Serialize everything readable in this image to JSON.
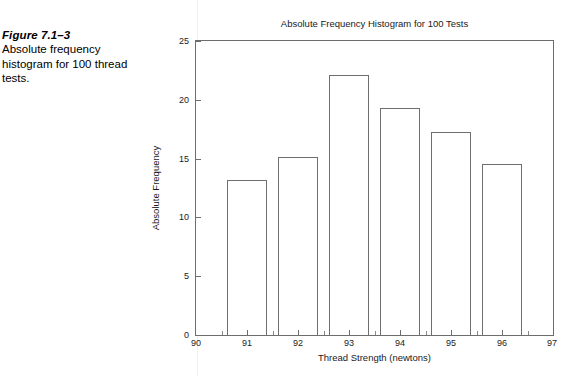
{
  "caption": {
    "figure_number": "Figure 7.1–3",
    "text": "Absolute frequency histogram for 100 thread tests."
  },
  "chart_data": {
    "type": "bar",
    "title": "Absolute Frequency Histogram for 100 Tests",
    "xlabel": "Thread Strength (newtons)",
    "ylabel": "Absolute Frequency",
    "categories": [
      "91",
      "92",
      "93",
      "94",
      "95",
      "96"
    ],
    "values": [
      13.2,
      15.1,
      22.1,
      19.3,
      17.3,
      14.5
    ],
    "x": [
      91,
      92,
      93,
      94,
      95,
      96
    ],
    "bar_width": 0.8,
    "xlim": [
      90,
      97
    ],
    "ylim": [
      0,
      25
    ],
    "xticks": [
      90,
      91,
      92,
      93,
      94,
      95,
      96,
      97
    ],
    "xtick_labels": [
      "90",
      "91",
      "92",
      "93",
      "94",
      "95",
      "96",
      "97"
    ],
    "xticks_minor": [
      90.5,
      91.5,
      92.5,
      93.5,
      94.5,
      95.5,
      96.5
    ],
    "yticks": [
      0,
      5,
      10,
      15,
      20,
      25
    ],
    "ytick_labels": [
      "0",
      "5",
      "10",
      "15",
      "20",
      "25"
    ],
    "grid": false,
    "legend": null,
    "bar_face_color": "#ffffff",
    "bar_edge_color": "#6f6f6f",
    "axes_color": "#6d6d6d",
    "text_color": "#1a1a1a"
  }
}
